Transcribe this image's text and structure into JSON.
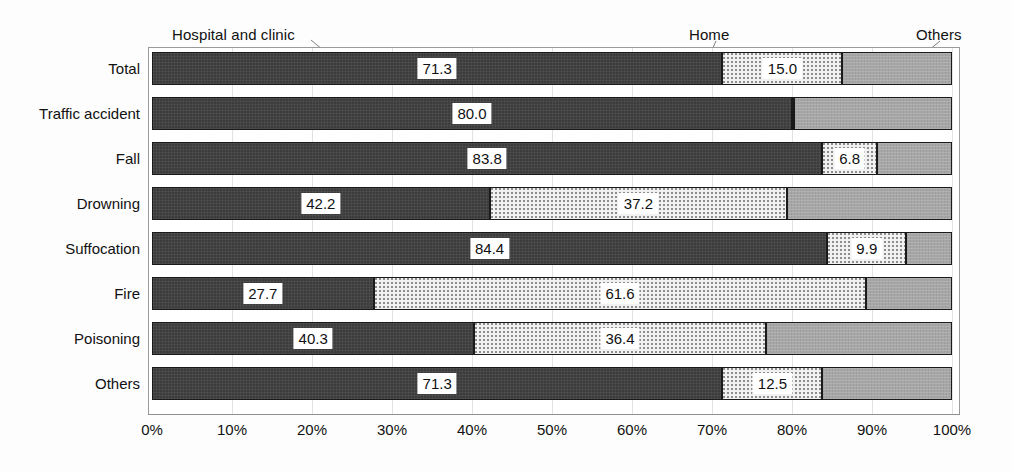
{
  "chart_data": {
    "type": "bar",
    "orientation": "horizontal",
    "stacked": true,
    "normalized_percent": true,
    "title": "",
    "subtitle": "",
    "xlabel": "",
    "ylabel": "",
    "xlim": [
      0,
      100
    ],
    "xticks": [
      "0%",
      "10%",
      "20%",
      "30%",
      "40%",
      "50%",
      "60%",
      "70%",
      "80%",
      "90%",
      "100%"
    ],
    "xtick_values": [
      0,
      10,
      20,
      30,
      40,
      50,
      60,
      70,
      80,
      90,
      100
    ],
    "grid": true,
    "legend_position": "above-plot-with-leader-lines",
    "categories": [
      "Total",
      "Traffic accident",
      "Fall",
      "Drowning",
      "Suffocation",
      "Fire",
      "Poisoning",
      "Others"
    ],
    "series": [
      {
        "name": "Hospital and clinic",
        "color": "#3c3c3c",
        "pattern": "solid-dark",
        "values": [
          71.3,
          80.0,
          83.8,
          42.2,
          84.4,
          27.7,
          40.3,
          71.3
        ],
        "labels": [
          "71.3",
          "80.0",
          "83.8",
          "42.2",
          "84.4",
          "27.7",
          "40.3",
          "71.3"
        ],
        "labels_shown": [
          true,
          true,
          true,
          true,
          true,
          true,
          true,
          true
        ]
      },
      {
        "name": "Home",
        "color": "#f1f1f1",
        "pattern": "dotted-light",
        "values": [
          15.0,
          0.3,
          6.8,
          37.2,
          9.9,
          61.6,
          36.4,
          12.5
        ],
        "labels": [
          "15.0",
          "",
          "6.8",
          "37.2",
          "9.9",
          "61.6",
          "36.4",
          "12.5"
        ],
        "labels_shown": [
          true,
          false,
          true,
          true,
          true,
          true,
          true,
          true
        ]
      },
      {
        "name": "Others",
        "color": "#a6a6a6",
        "pattern": "solid-mid-gray",
        "values": [
          13.7,
          19.7,
          9.4,
          20.6,
          5.7,
          10.7,
          23.3,
          16.2
        ],
        "labels": [
          "",
          "",
          "",
          "",
          "",
          "",
          "",
          ""
        ],
        "labels_shown": [
          false,
          false,
          false,
          false,
          false,
          false,
          false,
          false
        ]
      }
    ]
  },
  "series_callouts": [
    {
      "key": "hospital",
      "label": "Hospital and clinic"
    },
    {
      "key": "home",
      "label": "Home"
    },
    {
      "key": "others",
      "label": "Others"
    }
  ]
}
